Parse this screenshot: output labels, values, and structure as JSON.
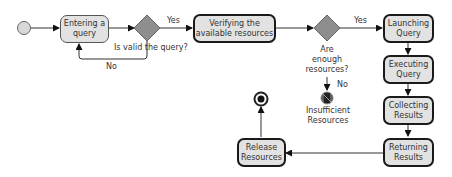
{
  "diagram": {
    "type": "UML activity diagram",
    "colors": {
      "node_fill": "#e2e2e2",
      "decision_fill": "#8e8e8e",
      "line": "#333333"
    },
    "actions": [
      {
        "id": "entering",
        "label": "Entering a query"
      },
      {
        "id": "verifying",
        "label": "Verifying the available resources"
      },
      {
        "id": "launching",
        "label": "Launching Query"
      },
      {
        "id": "executing",
        "label": "Executing Query"
      },
      {
        "id": "collecting",
        "label": "Collecting Results"
      },
      {
        "id": "returning",
        "label": "Returning Results"
      },
      {
        "id": "release",
        "label": "Release Resources"
      }
    ],
    "decisions": [
      {
        "id": "valid_query",
        "label": "Is valid the query?",
        "yes": "Yes",
        "no": "No"
      },
      {
        "id": "enough_resources",
        "label": "Are enough resources?",
        "yes": "Yes",
        "no": "No"
      }
    ],
    "final_nodes": [
      {
        "id": "flow_final",
        "label": "Insufficient Resources"
      },
      {
        "id": "activity_final",
        "label": ""
      }
    ]
  }
}
